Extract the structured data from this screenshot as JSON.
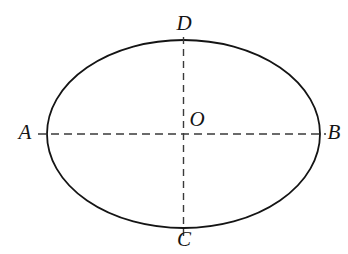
{
  "figure": {
    "type": "geometry-diagram",
    "shape": "ellipse",
    "background_color": "#ffffff",
    "stroke_color": "#141414",
    "axis_line_color": "#3a3a3a",
    "canvas": {
      "width": 348,
      "height": 254
    },
    "ellipse": {
      "center_x": 183.5,
      "center_y": 134,
      "radius_x": 136.5,
      "radius_y": 94,
      "stroke_width": 1.8
    },
    "axes": [
      {
        "name": "major-axis",
        "endpoints": "A-B",
        "orientation": "horizontal",
        "style": "dashed",
        "x1": 38,
        "y1": 134,
        "x2": 326,
        "y2": 134
      },
      {
        "name": "minor-axis",
        "endpoints": "C-D",
        "orientation": "vertical",
        "style": "dashed",
        "x1": 183.5,
        "y1": 37,
        "x2": 183.5,
        "y2": 239
      }
    ],
    "labels": [
      {
        "id": "A",
        "text": "A",
        "x": 25,
        "y": 134,
        "role": "left-vertex-label"
      },
      {
        "id": "B",
        "text": "B",
        "x": 334,
        "y": 134,
        "role": "right-vertex-label"
      },
      {
        "id": "C",
        "text": "C",
        "x": 184,
        "y": 241,
        "role": "bottom-vertex-label"
      },
      {
        "id": "D",
        "text": "D",
        "x": 184,
        "y": 25,
        "role": "top-vertex-label"
      },
      {
        "id": "O",
        "text": "O",
        "x": 197,
        "y": 121,
        "role": "centre-label"
      }
    ]
  }
}
